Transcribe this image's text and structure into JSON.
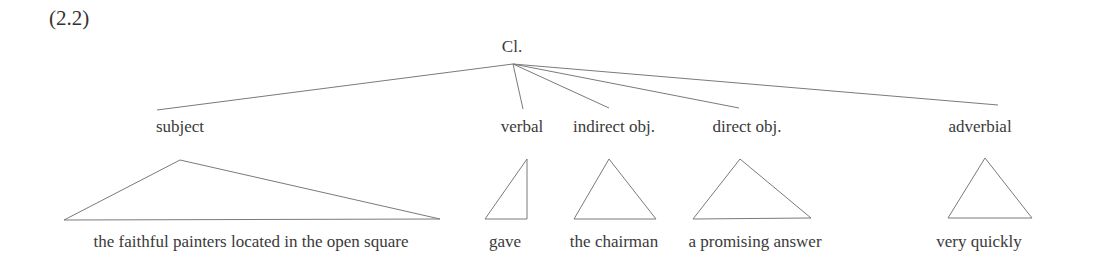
{
  "example_number": "(2.2)",
  "root": {
    "label": "Cl.",
    "x": 512,
    "y": 38,
    "apex": [
      513,
      64
    ]
  },
  "constituents": [
    {
      "role": "subject",
      "role_x": 180,
      "line_end": [
        157,
        110
      ],
      "phrase": "the faithful painters located in the open square",
      "phrase_x": 251,
      "triangle": [
        [
          180,
          160
        ],
        [
          64,
          220
        ],
        [
          440,
          219
        ]
      ]
    },
    {
      "role": "verbal",
      "role_x": 522,
      "line_end": [
        523,
        109
      ],
      "phrase": "gave",
      "phrase_x": 505,
      "triangle": [
        [
          527,
          159
        ],
        [
          485,
          219
        ],
        [
          527,
          219
        ]
      ]
    },
    {
      "role": "indirect obj.",
      "role_x": 614,
      "line_end": [
        609,
        108
      ],
      "phrase": "the chairman",
      "phrase_x": 614,
      "triangle": [
        [
          609,
          159
        ],
        [
          574,
          219
        ],
        [
          656,
          219
        ]
      ]
    },
    {
      "role": "direct obj.",
      "role_x": 747,
      "line_end": [
        739,
        108
      ],
      "phrase": "a promising answer",
      "phrase_x": 755,
      "triangle": [
        [
          740,
          159
        ],
        [
          693,
          219
        ],
        [
          811,
          218
        ]
      ]
    },
    {
      "role": "adverbial",
      "role_x": 980,
      "line_end": [
        998,
        105
      ],
      "phrase": "very quickly",
      "phrase_x": 979,
      "triangle": [
        [
          985,
          158
        ],
        [
          948,
          218
        ],
        [
          1032,
          218
        ]
      ]
    }
  ],
  "role_label_y": 118,
  "phrase_label_y": 233
}
